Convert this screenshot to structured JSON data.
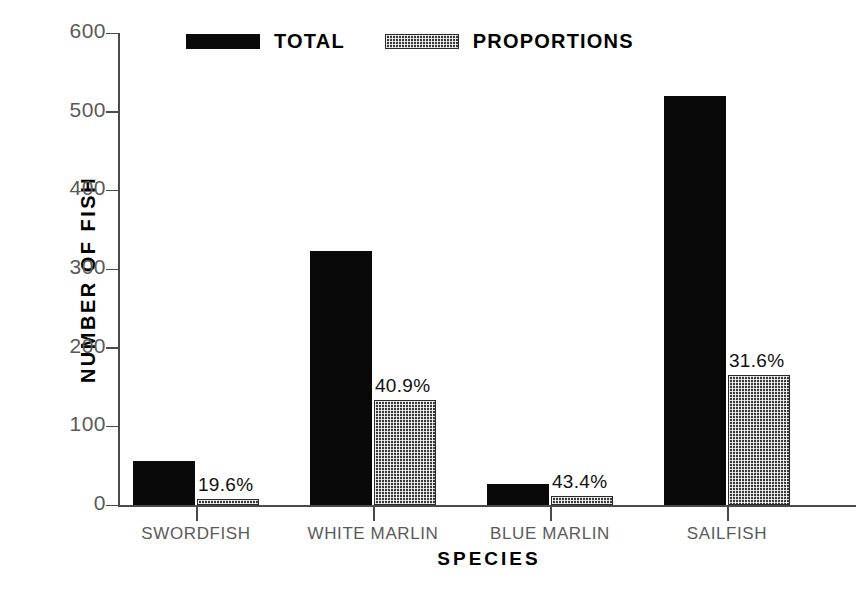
{
  "chart_data": {
    "type": "bar",
    "title": "",
    "xlabel": "SPECIES",
    "ylabel": "NUMBER OF FISH",
    "ylim": [
      0,
      600
    ],
    "yticks": [
      0,
      100,
      200,
      300,
      400,
      500,
      600
    ],
    "ytick_labels": [
      "0",
      "100",
      "200",
      "300",
      "400",
      "500",
      "600"
    ],
    "grid": false,
    "legend_position": "top-center",
    "categories": [
      "SWORDFISH",
      "WHITE MARLIN",
      "BLUE MARLIN",
      "SAILFISH"
    ],
    "series": [
      {
        "name": "TOTAL",
        "fill": "solid-black",
        "color": "#090909",
        "values": [
          56,
          323,
          27,
          520
        ]
      },
      {
        "name": "PROPORTIONS",
        "fill": "cross-hatch",
        "color": "#3a3a3a",
        "values": [
          8,
          133,
          11,
          165
        ]
      }
    ],
    "annotations": [
      {
        "category": "SWORDFISH",
        "text": "19.6%"
      },
      {
        "category": "WHITE MARLIN",
        "text": "40.9%"
      },
      {
        "category": "BLUE MARLIN",
        "text": "43.4%"
      },
      {
        "category": "SAILFISH",
        "text": "31.6%"
      }
    ]
  },
  "legend": {
    "items": [
      {
        "label": "TOTAL",
        "swatch": "solid-swatch"
      },
      {
        "label": "PROPORTIONS",
        "swatch": "hatched-swatch"
      }
    ]
  },
  "axes": {
    "y_title": "NUMBER OF FISH",
    "x_title": "SPECIES"
  }
}
